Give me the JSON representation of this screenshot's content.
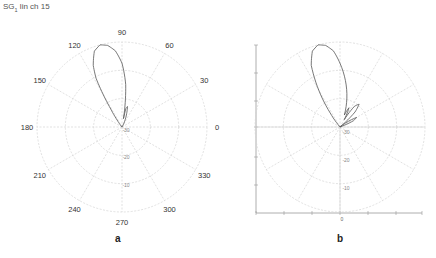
{
  "header": {
    "prefix": "SG",
    "subscript": "1",
    "suffix": " lin ch 15"
  },
  "panels": [
    {
      "label": "a"
    },
    {
      "label": "b"
    }
  ],
  "colors": {
    "grid": "#d4d4d4",
    "trace": "#555555",
    "text": "#333333",
    "axis": "#999999"
  },
  "chart_data": [
    {
      "type": "polar",
      "panel": "a",
      "title": "SG1 lin ch 15",
      "angle_ticks": [
        0,
        30,
        60,
        90,
        120,
        150,
        180,
        210,
        240,
        270,
        300,
        330
      ],
      "angle_tick_labels": [
        "0",
        "30",
        "60",
        "90",
        "120",
        "150",
        "180",
        "210",
        "240",
        "270",
        "300",
        "330"
      ],
      "radial_tick_labels": [
        "-30",
        "-20",
        "-10"
      ],
      "radial_range_db": [
        -40,
        0
      ],
      "grid": true,
      "series": [
        {
          "name": "radiation pattern",
          "angles_deg": [
            60,
            70,
            75,
            78,
            80,
            82,
            85,
            90,
            95,
            100,
            105,
            110,
            115,
            118,
            120,
            122,
            125,
            130
          ],
          "values_db": [
            -40,
            -34,
            -30,
            -31,
            -36,
            -30,
            -20,
            -10,
            -4,
            -1,
            0,
            -2,
            -8,
            -14,
            -22,
            -30,
            -36,
            -40
          ]
        }
      ]
    },
    {
      "type": "polar",
      "panel": "b",
      "radial_tick_labels": [
        "-30",
        "-20",
        "-10"
      ],
      "x_tick_labels": [
        "0"
      ],
      "radial_range_db": [
        -40,
        0
      ],
      "grid": true,
      "axes": {
        "left_vertical": true,
        "bottom_horizontal": true
      },
      "series": [
        {
          "name": "radiation pattern",
          "angles_deg": [
            20,
            25,
            30,
            35,
            40,
            45,
            50,
            55,
            60,
            65,
            70,
            80,
            90,
            95,
            100,
            105,
            110,
            115,
            120,
            125,
            130
          ],
          "values_db": [
            -40,
            -33,
            -31,
            -36,
            -40,
            -30,
            -26,
            -28,
            -36,
            -30,
            -34,
            -22,
            -10,
            -4,
            -1,
            0,
            -2,
            -8,
            -20,
            -32,
            -40
          ]
        }
      ]
    }
  ]
}
